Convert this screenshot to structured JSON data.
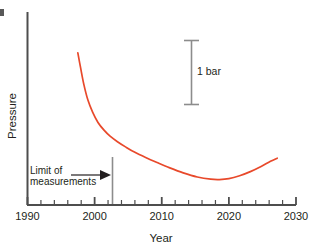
{
  "chart_data": {
    "type": "line",
    "title": "",
    "xlabel": "Year",
    "ylabel": "Pressure",
    "xlim": [
      1990,
      2030
    ],
    "ylim": [
      0,
      1
    ],
    "grid": false,
    "legend": null,
    "xticks": [
      1990,
      2000,
      2010,
      2020,
      2030
    ],
    "xtick_labels": [
      "1990",
      "2000",
      "2010",
      "2020",
      "2030"
    ],
    "xminor_tick_step": 2,
    "yticks": [],
    "ytick_labels": [],
    "series": [
      {
        "name": "Reservoir pressure",
        "color": "#E8492B",
        "x": [
          1997.5,
          1997.9,
          1998.4,
          1999.0,
          1999.7,
          2000.5,
          2001.4,
          2002.3,
          2003.4,
          2004.6,
          2006.0,
          2007.6,
          2009.3,
          2011.2,
          2013.2,
          2015.3,
          2017.3,
          2018.6,
          2020.0,
          2021.6,
          2023.2,
          2024.8,
          2026.2,
          2027.2
        ],
        "y": [
          0.885,
          0.8,
          0.7,
          0.61,
          0.54,
          0.48,
          0.435,
          0.4,
          0.368,
          0.338,
          0.306,
          0.276,
          0.247,
          0.216,
          0.187,
          0.163,
          0.15,
          0.148,
          0.153,
          0.17,
          0.194,
          0.224,
          0.254,
          0.272
        ]
      }
    ],
    "annotations": [
      {
        "name": "limit-of-measurements",
        "text_line1": "Limit of",
        "text_line2": "measurements",
        "arrow_from_year": 2002.3,
        "marker_year": 2002.3,
        "color": "#808080"
      },
      {
        "name": "scale-bar",
        "label": "1 bar",
        "value": 1,
        "unit": "bar",
        "color": "#808080"
      }
    ]
  },
  "axes": {
    "x": {
      "label": "Year",
      "ticks": [
        {
          "label": "1990"
        },
        {
          "label": "2000"
        },
        {
          "label": "2010"
        },
        {
          "label": "2020"
        },
        {
          "label": "2030"
        }
      ]
    },
    "y": {
      "label": "Pressure"
    }
  },
  "annotations": {
    "limit": {
      "line1": "Limit of",
      "line2": "measurements"
    },
    "scalebar": {
      "label": "1 bar"
    }
  }
}
